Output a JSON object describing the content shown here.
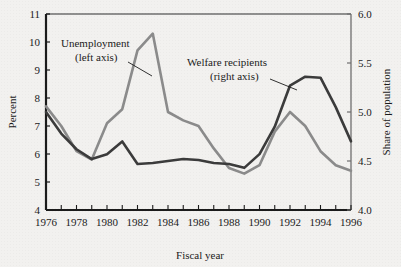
{
  "chart_data": {
    "type": "line",
    "title": "",
    "xlabel": "Fiscal year",
    "ylabel": "Percent",
    "ylabel_right": "Share of population",
    "grid": false,
    "legend": "annotations",
    "x": [
      1976,
      1977,
      1978,
      1979,
      1980,
      1981,
      1982,
      1983,
      1984,
      1985,
      1986,
      1987,
      1988,
      1989,
      1990,
      1991,
      1992,
      1993,
      1994,
      1995,
      1996
    ],
    "xlim": [
      1976,
      1996
    ],
    "xticks": [
      1976,
      1977,
      1978,
      1979,
      1980,
      1981,
      1982,
      1983,
      1984,
      1985,
      1986,
      1987,
      1988,
      1989,
      1990,
      1991,
      1992,
      1993,
      1994,
      1995,
      1996
    ],
    "xtick_labels": [
      "1976",
      "",
      "1978",
      "",
      "1980",
      "",
      "1982",
      "",
      "1984",
      "",
      "1986",
      "",
      "1988",
      "",
      "1990",
      "",
      "1992",
      "",
      "1994",
      "",
      "1996"
    ],
    "ylim": [
      4,
      11
    ],
    "yticks": [
      4,
      5,
      6,
      7,
      8,
      9,
      10,
      11
    ],
    "ytick_labels": [
      "4",
      "5",
      "6",
      "7",
      "8",
      "9",
      "10",
      "11"
    ],
    "ylim_right": [
      4.0,
      6.0
    ],
    "yticks_right": [
      4.0,
      4.5,
      5.0,
      5.5,
      6.0
    ],
    "ytick_labels_right": [
      "4.0",
      "4.5",
      "5.0",
      "5.5",
      "6.0"
    ],
    "series": [
      {
        "name": "Unemployment",
        "axis": "left",
        "color": "#8b8b8b",
        "annotation": "Unemployment\n(left axis)",
        "values": [
          7.7,
          7.0,
          6.1,
          5.8,
          7.1,
          7.6,
          9.7,
          10.3,
          7.5,
          7.2,
          7.0,
          6.2,
          5.5,
          5.3,
          5.6,
          6.8,
          7.5,
          7.0,
          6.1,
          5.6,
          5.4
        ]
      },
      {
        "name": "Welfare recipients",
        "axis": "right",
        "color": "#3b3b3b",
        "annotation": "Welfare recipients\n(right axis)",
        "values": [
          5.0,
          4.78,
          4.62,
          4.52,
          4.57,
          4.7,
          4.47,
          4.48,
          4.5,
          4.52,
          4.51,
          4.48,
          4.47,
          4.43,
          4.57,
          4.85,
          5.27,
          5.36,
          5.35,
          5.05,
          4.7
        ]
      }
    ],
    "annotations": [
      {
        "name": "unemployment-label",
        "text_line1": "Unemployment",
        "text_line2": "(left axis)"
      },
      {
        "name": "welfare-label",
        "text_line1": "Welfare recipients",
        "text_line2": "(right axis)"
      }
    ]
  }
}
